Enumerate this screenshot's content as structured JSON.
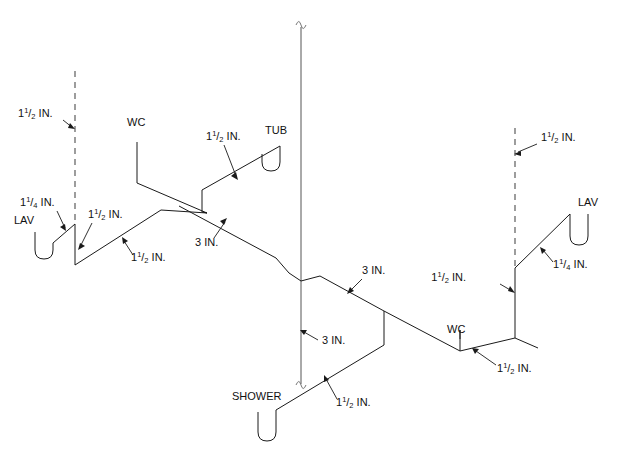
{
  "diagram": {
    "type": "isometric-piping-diagram",
    "background_color": "#ffffff",
    "line_color": "#1a1a1a",
    "vent_line_color": "#4d4d4d"
  },
  "fixtures": [
    {
      "id": "lav-left",
      "label": "LAV",
      "x": 14,
      "y": 224
    },
    {
      "id": "wc-left",
      "label": "WC",
      "x": 127,
      "y": 126
    },
    {
      "id": "tub",
      "label": "TUB",
      "x": 265,
      "y": 134
    },
    {
      "id": "shower",
      "label": "SHOWER",
      "x": 232,
      "y": 400
    },
    {
      "id": "wc-right",
      "label": "WC",
      "x": 447,
      "y": 333
    },
    {
      "id": "lav-right",
      "label": "LAV",
      "x": 578,
      "y": 206
    }
  ],
  "size_labels": [
    {
      "id": "vent-left-top",
      "whole": "1",
      "num": "1",
      "den": "2",
      "unit": "IN.",
      "x": 18,
      "y": 117
    },
    {
      "id": "lav-left-trap-arm",
      "whole": "1",
      "num": "1",
      "den": "4",
      "unit": "IN.",
      "x": 20,
      "y": 206
    },
    {
      "id": "lav-left-branch",
      "whole": "1",
      "num": "1",
      "den": "2",
      "unit": "IN.",
      "x": 88,
      "y": 218
    },
    {
      "id": "wc-left-branch",
      "whole": "1",
      "num": "1",
      "den": "2",
      "unit": "IN.",
      "x": 131,
      "y": 261
    },
    {
      "id": "tub-branch",
      "whole": "1",
      "num": "1",
      "den": "2",
      "unit": "IN.",
      "x": 206,
      "y": 140
    },
    {
      "id": "main-3-upper",
      "whole": "3",
      "num": "",
      "den": "",
      "unit": "IN.",
      "x": 195,
      "y": 246
    },
    {
      "id": "main-3-mid",
      "whole": "3",
      "num": "",
      "den": "",
      "unit": "IN.",
      "x": 362,
      "y": 274
    },
    {
      "id": "stack-3-lower",
      "whole": "3",
      "num": "",
      "den": "",
      "unit": "IN.",
      "x": 322,
      "y": 344
    },
    {
      "id": "shower-branch",
      "whole": "1",
      "num": "1",
      "den": "2",
      "unit": "IN.",
      "x": 336,
      "y": 406
    },
    {
      "id": "wc-right-branch",
      "whole": "1",
      "num": "1",
      "den": "2",
      "unit": "IN.",
      "x": 497,
      "y": 372
    },
    {
      "id": "vent-right-lower",
      "whole": "1",
      "num": "1",
      "den": "2",
      "unit": "IN.",
      "x": 466,
      "y": 281
    },
    {
      "id": "lav-right-trap-arm",
      "whole": "1",
      "num": "1",
      "den": "4",
      "unit": "IN.",
      "x": 553,
      "y": 268
    },
    {
      "id": "vent-right-top",
      "whole": "1",
      "num": "1",
      "den": "2",
      "unit": "IN.",
      "x": 541,
      "y": 141
    }
  ],
  "notes": {
    "vent_style": "dashed",
    "drain_style": "solid",
    "break_symbol": "~"
  }
}
